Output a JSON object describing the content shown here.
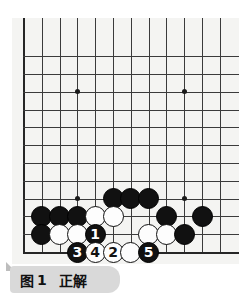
{
  "figure": {
    "caption_prefix": "图",
    "caption_number": "1",
    "caption_text": "正解",
    "caption_full": "图 1 正解"
  },
  "board": {
    "type": "go-board-diagram",
    "cols": 12,
    "rows": 12,
    "origin_edge": "bottom-left",
    "cell_px": 17.8,
    "star_points": [
      {
        "col": 3,
        "row": 9
      },
      {
        "col": 9,
        "row": 9
      },
      {
        "col": 3,
        "row": 3
      },
      {
        "col": 9,
        "row": 3
      }
    ],
    "colors": {
      "background": "#f4f4f2",
      "grid": "#3b3b3b",
      "edge": "#262626",
      "black_stone": "#111111",
      "white_stone": "#fdfdfd",
      "caption_bg": "#d9d9d9"
    },
    "stones": [
      {
        "col": 5,
        "row": 3,
        "color": "black",
        "label": ""
      },
      {
        "col": 6,
        "row": 3,
        "color": "black",
        "label": ""
      },
      {
        "col": 7,
        "row": 3,
        "color": "black",
        "label": ""
      },
      {
        "col": 1,
        "row": 2,
        "color": "black",
        "label": ""
      },
      {
        "col": 2,
        "row": 2,
        "color": "black",
        "label": ""
      },
      {
        "col": 3,
        "row": 2,
        "color": "black",
        "label": ""
      },
      {
        "col": 4,
        "row": 2,
        "color": "white",
        "label": ""
      },
      {
        "col": 5,
        "row": 2,
        "color": "white",
        "label": ""
      },
      {
        "col": 8,
        "row": 2,
        "color": "black",
        "label": ""
      },
      {
        "col": 10,
        "row": 2,
        "color": "black",
        "label": ""
      },
      {
        "col": 1,
        "row": 1,
        "color": "black",
        "label": ""
      },
      {
        "col": 2,
        "row": 1,
        "color": "white",
        "label": ""
      },
      {
        "col": 3,
        "row": 1,
        "color": "white",
        "label": ""
      },
      {
        "col": 4,
        "row": 1,
        "color": "black",
        "label": "1"
      },
      {
        "col": 7,
        "row": 1,
        "color": "white",
        "label": ""
      },
      {
        "col": 8,
        "row": 1,
        "color": "white",
        "label": ""
      },
      {
        "col": 9,
        "row": 1,
        "color": "black",
        "label": ""
      },
      {
        "col": 3,
        "row": 0,
        "color": "black",
        "label": "3"
      },
      {
        "col": 4,
        "row": 0,
        "color": "white",
        "label": "4"
      },
      {
        "col": 5,
        "row": 0,
        "color": "white",
        "label": "2"
      },
      {
        "col": 6,
        "row": 0,
        "color": "white",
        "label": ""
      },
      {
        "col": 7,
        "row": 0,
        "color": "black",
        "label": "5"
      }
    ],
    "move_sequence": [
      {
        "number": 1,
        "color": "black",
        "col": 4,
        "row": 1
      },
      {
        "number": 2,
        "color": "white",
        "col": 5,
        "row": 0
      },
      {
        "number": 3,
        "color": "black",
        "col": 3,
        "row": 0
      },
      {
        "number": 4,
        "color": "white",
        "col": 4,
        "row": 0
      },
      {
        "number": 5,
        "color": "black",
        "col": 7,
        "row": 0
      }
    ]
  }
}
